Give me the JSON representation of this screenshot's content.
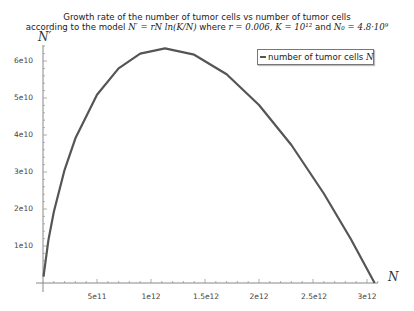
{
  "chart_data": {
    "type": "line",
    "title": "Growth rate of the number of tumor cells vs number of tumor cells",
    "subtitle": "according to the model N' = rN ln(K/N) where r = 0.006, K = 10^12 and N0 = 4.8·10^9",
    "title_parts": {
      "line1": "Growth rate of the number of tumor cells vs number of tumor cells",
      "line2_prefix": "according to the model ",
      "formula": "N′ = rN ln(K/N)",
      "where": " where ",
      "r": "r = 0.006,",
      "K": "K = 10¹²",
      "and": " and ",
      "N0": "N₀ = 4.8·10⁹"
    },
    "xlabel": "N",
    "ylabel": "N'",
    "xlim": [
      0,
      3100000000000.0
    ],
    "ylim": [
      0,
      65000000000.0
    ],
    "x_ticks": [
      "5e11",
      "1e12",
      "1.5e12",
      "2e12",
      "2.5e12",
      "3e12"
    ],
    "y_ticks": [
      "1e10",
      "2e10",
      "3e10",
      "4e10",
      "5e10",
      "6e10"
    ],
    "grid": false,
    "legend_position": "upper right",
    "series": [
      {
        "name": "number of tumor cells N",
        "color": "#555555",
        "x": [
          4800000000.0,
          50000000000.0,
          100000000000.0,
          200000000000.0,
          300000000000.0,
          500000000000.0,
          700000000000.0,
          900000000000.0,
          1130000000000.0,
          1400000000000.0,
          1700000000000.0,
          2000000000000.0,
          2300000000000.0,
          2600000000000.0,
          2850000000000.0,
          3070000000000.0
        ],
        "y": [
          1740000000.0,
          11600000000.0,
          19200000000.0,
          30600000000.0,
          39100000000.0,
          50900000000.0,
          58000000000.0,
          62000000000.0,
          63400000000.0,
          61700000000.0,
          56400000000.0,
          48100000000.0,
          37300000000.0,
          24200000000.0,
          11900000000.0,
          0
        ]
      }
    ]
  },
  "legend": {
    "label": "number of tumor cells ",
    "var": "N"
  },
  "axes": {
    "x_label": "N",
    "y_label": "N′"
  }
}
